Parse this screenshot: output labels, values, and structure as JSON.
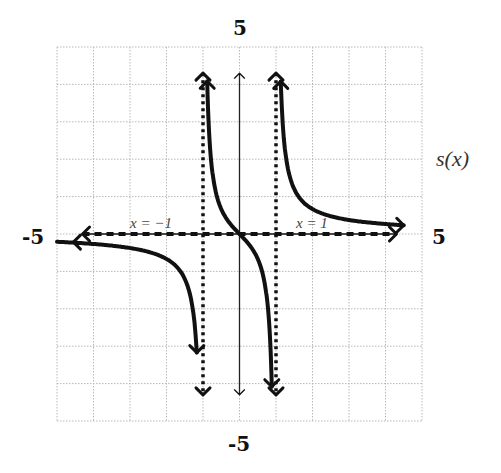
{
  "chart_data": {
    "type": "line",
    "title": "",
    "function_label": "s(x)",
    "xlabel": "",
    "ylabel": "s(x)",
    "xlim": [
      -5,
      5
    ],
    "ylim": [
      -5,
      5
    ],
    "grid": true,
    "grid_step": 1,
    "axis_end_labels": {
      "x_min": "-5",
      "x_max": "5",
      "y_max": "5",
      "y_min": "-5"
    },
    "asymptotes": [
      {
        "type": "vertical",
        "x": -1,
        "label": "x = -1",
        "style": "dotted"
      },
      {
        "type": "vertical",
        "x": 1,
        "label": "x = 1",
        "style": "dotted"
      },
      {
        "type": "horizontal",
        "y": 0,
        "style": "dashed"
      }
    ],
    "series": [
      {
        "name": "left branch",
        "x": [
          -4.9,
          -4,
          -3,
          -2,
          -1.5,
          -1.2,
          -1.1
        ],
        "y": [
          -0.2,
          -0.27,
          -0.38,
          -0.67,
          -1.2,
          -2.7,
          -3.4
        ]
      },
      {
        "name": "middle branch",
        "x": [
          -0.87,
          -0.8,
          -0.5,
          0,
          0.5,
          0.8,
          0.9
        ],
        "y": [
          4.1,
          2.2,
          0.67,
          0,
          -0.67,
          -2.2,
          -4.2
        ]
      },
      {
        "name": "right branch",
        "x": [
          1.1,
          1.2,
          1.5,
          2,
          3,
          4,
          4.9
        ],
        "y": [
          3.4,
          2.7,
          1.2,
          0.67,
          0.38,
          0.27,
          0.2
        ]
      }
    ],
    "legend": []
  }
}
